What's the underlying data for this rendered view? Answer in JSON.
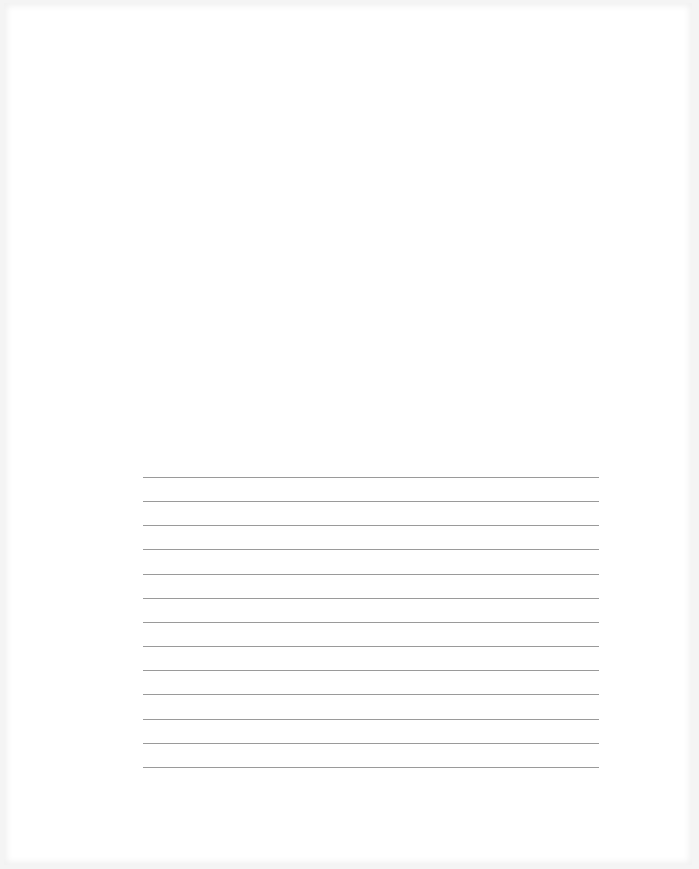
{
  "document": {
    "type": "blank ruled page",
    "ruled_lines": {
      "count": 13,
      "spacing_px": 24,
      "color": "#9a9a9a"
    }
  }
}
